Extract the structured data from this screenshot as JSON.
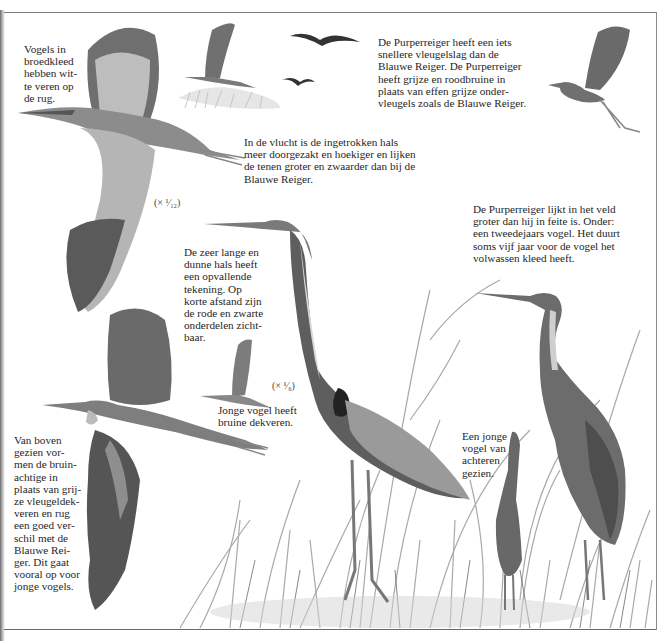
{
  "page": {
    "subject": "Purperreiger",
    "captions": {
      "breeding_plumage": "Vogels in\nbroedkleed\nhebben wit-\nte veren op\nde rug.",
      "wingbeat": "De Purperreiger heeft een iets\nsnellere vleugelslag dan de\nBlauwe Reiger. De Purperreiger\nheeft grijze en roodbruine in\nplaats van effen grijze onder-\nvleugels zoals de Blauwe Reiger.",
      "flight_neck": "In de vlucht is de ingetrokken hals\nmeer doorgezakt en hoekiger en lijken\nde tenen groter en zwaarder dan bij de\nBlauwe Reiger.",
      "field_size": "De Purperreiger lijkt in het veld\ngroter dan hij in feite is. Onder:\neen tweedejaars vogel. Het duurt\nsoms vijf jaar voor de vogel het\nvolwassen kleed heeft.",
      "neck_pattern": "De zeer lange en\ndunne hals heeft\neen opvallende\ntekening. Op\nkorte afstand zijn\nde rode en zwarte\nonderdelen zicht-\nbaar.",
      "juvenile_coverts": "Jonge vogel heeft\nbruine dekveren.",
      "from_above": "Van boven\ngezien vor-\nmen de bruin-\nachtige in\nplaats van grij-\nze vleugeldek-\nveren en rug\neen goed ver-\nschil met de\nBlauwe Rei-\nger. Dit gaat\nvooral op voor\njonge vogels.",
      "young_from_behind": "Een jonge\nvogel van\nachteren\ngezien."
    },
    "scales": {
      "flight_scale": "(× ¹⁄₁₂)",
      "standing_scale": "(× ¹⁄₆)"
    },
    "colors": {
      "ink": "#262626",
      "frame": "#7a7a7a",
      "wing_dark": "#4a4a4a",
      "wing_mid": "#8c8c8c",
      "wing_light": "#c8c8c8",
      "reed": "#9a9a9a",
      "paper": "#ffffff"
    }
  }
}
